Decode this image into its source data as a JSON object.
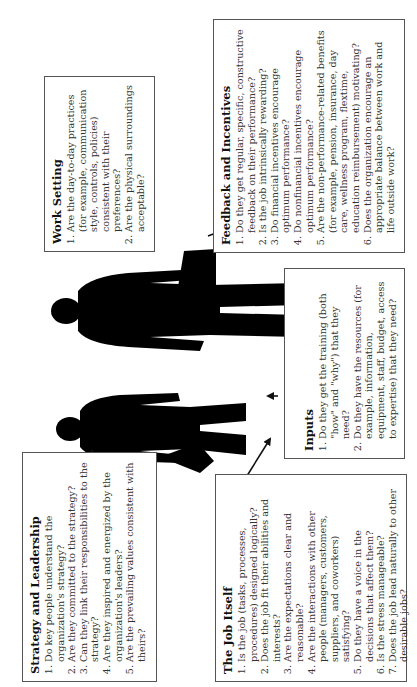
{
  "figure": {
    "orientation": "rotated 90° counter-clockwise",
    "center_graphic": "two silhouetted business people (man and woman) standing",
    "boxes": [
      {
        "id": "strategy",
        "title": "Strategy and Leadership",
        "items": [
          "Do key people understand the organization's strategy?",
          "Are they committed to the strategy?",
          "Can they link their responsibilities to the strategy?",
          "Are they inspired and energized by the organization's leaders?",
          "Are the prevailing values consistent with theirs?"
        ]
      },
      {
        "id": "job",
        "title": "The Job Itself",
        "items": [
          "Is the job (tasks, processes, procedures) designed logically?",
          "Does the job fit their abilities and interests?",
          "Are the expectations clear and reasonable?",
          "Are the interactions with other people (managers, customers, suppliers, and coworkers) satisfying?",
          "Do they have a voice in the decisions that affect them?",
          "Is the stress manageable?",
          "Does the job lead naturally to other desirable jobs?"
        ]
      },
      {
        "id": "inputs",
        "title": "Inputs",
        "items": [
          "Do they get the training (both \"how\" and \"why\") that they need?",
          "Do they have the resources (for example, information, equipment, staff, budget, access to expertise) that they need?"
        ]
      },
      {
        "id": "work",
        "title": "Work Setting",
        "items": [
          "Are the day-to-day practices (for example, communication style, controls, policies) consistent with their preferences?",
          "Are the physical surroundings acceptable?"
        ]
      },
      {
        "id": "feedback",
        "title": "Feedback and Incentives",
        "items": [
          "Do they get regular, specific, constructive feedback on their performance?",
          "Is the job intrinsically rewarding?",
          "Do financial incentives encourage optimum performance?",
          "Do nonfinancial incentives encourage optimum performance?",
          "Are the non-performance-related benefits (for example, pension, insurance, day care, wellness program, flextime, education reimbursement) motivating?",
          "Does the organization encourage an appropriate balance between work and life outside work?"
        ]
      }
    ]
  }
}
